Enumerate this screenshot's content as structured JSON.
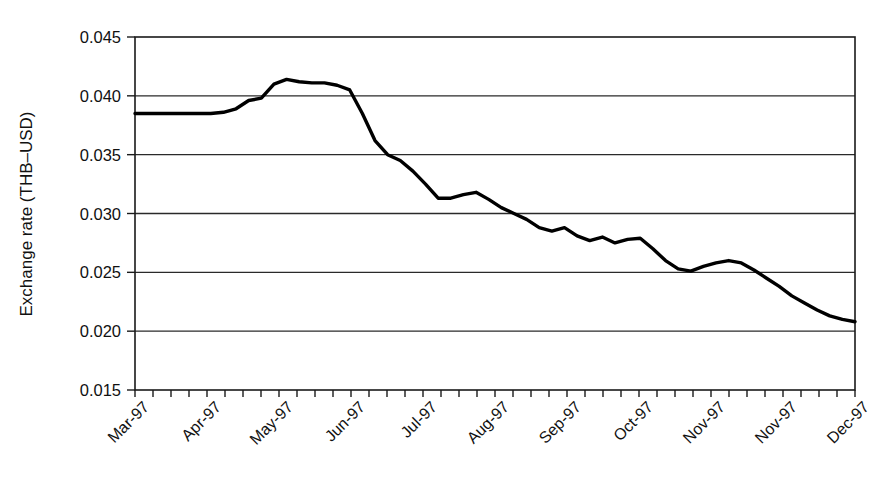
{
  "chart_data": {
    "type": "line",
    "title": "",
    "xlabel": "",
    "ylabel": "Exchange rate (THB–USD)",
    "ylim": [
      0.015,
      0.045
    ],
    "ytick_labels": [
      "0.045",
      "0.040",
      "0.035",
      "0.030",
      "0.025",
      "0.020",
      "0.015"
    ],
    "ytick_values": [
      0.045,
      0.04,
      0.035,
      0.03,
      0.025,
      0.02,
      0.015
    ],
    "xtick_labels": [
      "Mar-97",
      "Apr-97",
      "May-97",
      "Jun-97",
      "Jul-97",
      "Aug-97",
      "Sep-97",
      "Oct-97",
      "Nov-97",
      "Nov-97",
      "Dec-97"
    ],
    "xtick_label_positions": [
      0.5,
      4.5,
      8.5,
      12.5,
      16.5,
      20.5,
      24.5,
      28.5,
      32.5,
      36.5,
      40.5
    ],
    "grid": "horizontal",
    "legend": "none",
    "minor_ticks_per_axis": 41,
    "series": [
      {
        "name": "THB-USD exchange rate",
        "color": "#000000",
        "x": [
          0,
          1,
          2,
          3,
          4,
          5,
          6,
          7,
          8,
          9,
          10,
          11,
          12,
          13,
          14,
          15,
          16,
          17,
          18,
          19,
          20,
          21,
          22,
          23,
          24,
          25,
          26,
          27,
          28,
          29,
          30,
          31,
          32,
          33,
          34,
          35,
          36,
          37,
          38,
          39,
          40
        ],
        "values": [
          0.0385,
          0.0385,
          0.0385,
          0.0385,
          0.0385,
          0.0385,
          0.0385,
          0.0386,
          0.0389,
          0.0396,
          0.0398,
          0.041,
          0.0414,
          0.0412,
          0.0411,
          0.0411,
          0.0409,
          0.0405,
          0.0385,
          0.0362,
          0.035,
          0.0345,
          0.0336,
          0.0325,
          0.0313,
          0.0313,
          0.0316,
          0.0318,
          0.0312,
          0.0305,
          0.03,
          0.0295,
          0.0288,
          0.0285,
          0.0288,
          0.0281,
          0.0277,
          0.028,
          0.0275,
          0.0278,
          0.0279
        ]
      }
    ],
    "values_extended": [
      0.0385,
      0.0385,
      0.0385,
      0.0385,
      0.0385,
      0.0385,
      0.0385,
      0.0386,
      0.0389,
      0.0396,
      0.0398,
      0.041,
      0.0414,
      0.0412,
      0.0411,
      0.0411,
      0.0409,
      0.0405,
      0.0385,
      0.0362,
      0.035,
      0.0345,
      0.0336,
      0.0325,
      0.0313,
      0.0313,
      0.0316,
      0.0318,
      0.0312,
      0.0305,
      0.03,
      0.0295,
      0.0288,
      0.0285,
      0.0288,
      0.0281,
      0.0277,
      0.028,
      0.0275,
      0.0278,
      0.0279,
      0.027,
      0.026,
      0.0253,
      0.0251,
      0.0255,
      0.0258,
      0.026,
      0.0258,
      0.0252,
      0.0245,
      0.0238,
      0.023,
      0.0224,
      0.0218,
      0.0213,
      0.021,
      0.0208
    ],
    "peak": {
      "value": 0.0414,
      "label": "Jun-97 peak"
    },
    "end_value": 0.0208,
    "start_value": 0.0385
  },
  "axes": {
    "y_axis_title": "Exchange rate (THB–USD)"
  }
}
